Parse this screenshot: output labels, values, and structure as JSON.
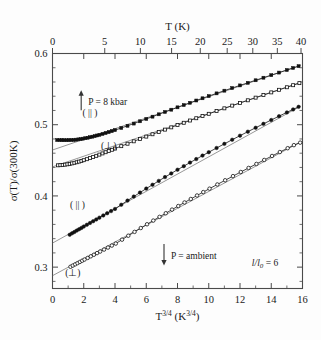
{
  "figure": {
    "name": "conductivity-vs-temperature-plot",
    "background": "#fdfdfd",
    "ink_color": "#111111"
  },
  "chart_data": {
    "type": "scatter",
    "title": "",
    "xlabel": "T3/4 (K3/4)",
    "xlabel_parts": {
      "base": "T",
      "exp": "3/4",
      "unit_base": "K",
      "unit_exp": "3/4"
    },
    "ylabel": "σ(T)/σ(300K)",
    "top_axis_label": "T (K)",
    "xlim": [
      0,
      16
    ],
    "ylim": [
      0.27,
      0.6
    ],
    "xticks": [
      0,
      2,
      4,
      6,
      8,
      10,
      12,
      14,
      16
    ],
    "xticklabels": [
      "0",
      "2",
      "4",
      "6",
      "8",
      "10",
      "12",
      "14",
      "16"
    ],
    "yticks": [
      0.3,
      0.4,
      0.5,
      0.6
    ],
    "yticklabels": [
      "0.3",
      "0.4",
      "0.5",
      "0.6"
    ],
    "top_ticks": [
      0,
      5,
      10,
      15,
      20,
      25,
      30,
      35,
      40
    ],
    "top_ticklabels": [
      "0",
      "5",
      "10",
      "15",
      "20",
      "25",
      "30",
      "35",
      "40"
    ],
    "grid": false,
    "legend_position": "inline-annotations",
    "annotations": [
      {
        "id": "pressure-8kbar",
        "text": "P = 8 kbar",
        "x": 1.9,
        "y": 0.533,
        "arrow": "up"
      },
      {
        "id": "pressure-ambient",
        "text": "P = ambient",
        "x": 7.2,
        "y": 0.317,
        "arrow": "down"
      },
      {
        "id": "disorder-ratio",
        "text": "l/l0 = 6",
        "x": 13.6,
        "y": 0.302
      },
      {
        "id": "label-8kbar-parallel",
        "text": "( || )",
        "x": 2.4,
        "y": 0.512
      },
      {
        "id": "label-8kbar-perp",
        "text": "(⊥)",
        "x": 3.6,
        "y": 0.466
      },
      {
        "id": "label-ambient-parallel",
        "text": "( || )",
        "x": 1.6,
        "y": 0.383
      },
      {
        "id": "label-ambient-perp",
        "text": "(⊥)",
        "x": 1.3,
        "y": 0.288
      }
    ],
    "series": [
      {
        "name": "P = 8 kbar, parallel",
        "short": "8kbar-parallel",
        "marker": "filled-square",
        "color": "#111111",
        "x": [
          0.3,
          0.45,
          0.6,
          0.75,
          0.9,
          1.05,
          1.2,
          1.35,
          1.5,
          1.65,
          1.8,
          1.95,
          2.1,
          2.25,
          2.4,
          2.55,
          2.7,
          2.85,
          3.0,
          3.2,
          3.4,
          3.6,
          3.8,
          4.0,
          4.4,
          4.8,
          5.2,
          5.6,
          6.0,
          6.4,
          6.8,
          7.2,
          7.6,
          8.0,
          8.4,
          8.8,
          9.2,
          9.6,
          10.0,
          10.5,
          11.0,
          11.5,
          12.0,
          12.5,
          13.0,
          13.5,
          14.0,
          14.5,
          15.0,
          15.4,
          15.75
        ],
        "y": [
          0.4785,
          0.4784,
          0.4783,
          0.4782,
          0.4782,
          0.4783,
          0.4785,
          0.4787,
          0.479,
          0.4794,
          0.4799,
          0.4804,
          0.481,
          0.4817,
          0.4824,
          0.4832,
          0.484,
          0.4849,
          0.4858,
          0.487,
          0.4883,
          0.4896,
          0.491,
          0.4924,
          0.4954,
          0.4985,
          0.5016,
          0.5048,
          0.5081,
          0.5113,
          0.5146,
          0.5179,
          0.5211,
          0.5244,
          0.5276,
          0.5308,
          0.534,
          0.5371,
          0.5402,
          0.544,
          0.5478,
          0.5515,
          0.5552,
          0.5588,
          0.5624,
          0.566,
          0.5696,
          0.5732,
          0.5768,
          0.5797,
          0.5822
        ]
      },
      {
        "name": "P = 8 kbar, perpendicular",
        "short": "8kbar-perp",
        "marker": "open-square",
        "color": "#111111",
        "x": [
          0.35,
          0.5,
          0.65,
          0.8,
          0.95,
          1.1,
          1.25,
          1.4,
          1.55,
          1.7,
          1.85,
          2.0,
          2.2,
          2.4,
          2.6,
          2.8,
          3.0,
          3.2,
          3.4,
          3.6,
          3.8,
          4.0,
          4.4,
          4.8,
          5.2,
          5.6,
          6.0,
          6.4,
          6.8,
          7.2,
          7.6,
          8.0,
          8.4,
          8.8,
          9.2,
          9.6,
          10.0,
          10.5,
          11.0,
          11.5,
          12.0,
          12.5,
          13.0,
          13.5,
          14.0,
          14.5,
          15.0,
          15.4,
          15.8
        ],
        "y": [
          0.443,
          0.4432,
          0.4435,
          0.4439,
          0.4444,
          0.445,
          0.4457,
          0.4465,
          0.4473,
          0.4482,
          0.4492,
          0.4502,
          0.4516,
          0.4531,
          0.4547,
          0.4563,
          0.458,
          0.4597,
          0.4614,
          0.4631,
          0.4648,
          0.4665,
          0.4699,
          0.4733,
          0.4767,
          0.48,
          0.4833,
          0.4866,
          0.4899,
          0.4931,
          0.4963,
          0.4995,
          0.5027,
          0.5059,
          0.5091,
          0.5122,
          0.5153,
          0.5192,
          0.523,
          0.5268,
          0.5306,
          0.5343,
          0.538,
          0.5417,
          0.5454,
          0.549,
          0.5526,
          0.5555,
          0.5584
        ]
      },
      {
        "name": "P = ambient, parallel",
        "short": "ambient-parallel",
        "marker": "filled-circle",
        "color": "#111111",
        "x": [
          1.1,
          1.25,
          1.4,
          1.55,
          1.7,
          1.85,
          2.0,
          2.2,
          2.4,
          2.6,
          2.8,
          3.0,
          3.25,
          3.5,
          3.75,
          4.0,
          4.4,
          4.8,
          5.2,
          5.6,
          6.0,
          6.4,
          6.8,
          7.2,
          7.6,
          8.0,
          8.4,
          8.8,
          9.2,
          9.6,
          10.0,
          10.5,
          11.0,
          11.5,
          12.0,
          12.5,
          13.0,
          13.5,
          14.0,
          14.5,
          15.0,
          15.4,
          15.75
        ],
        "y": [
          0.3455,
          0.3475,
          0.3494,
          0.3513,
          0.3532,
          0.3551,
          0.357,
          0.3595,
          0.362,
          0.3645,
          0.367,
          0.3695,
          0.3726,
          0.3757,
          0.3787,
          0.3817,
          0.3876,
          0.3934,
          0.3991,
          0.4047,
          0.4103,
          0.4157,
          0.4211,
          0.4264,
          0.4316,
          0.4368,
          0.4418,
          0.4468,
          0.4517,
          0.4566,
          0.4614,
          0.4673,
          0.4731,
          0.4789,
          0.4846,
          0.4902,
          0.4957,
          0.5012,
          0.5066,
          0.512,
          0.5173,
          0.5215,
          0.5251
        ]
      },
      {
        "name": "P = ambient, perpendicular",
        "short": "ambient-perp",
        "marker": "open-circle",
        "color": "#111111",
        "x": [
          1.15,
          1.3,
          1.45,
          1.6,
          1.75,
          1.9,
          2.05,
          2.25,
          2.45,
          2.65,
          2.85,
          3.05,
          3.3,
          3.55,
          3.8,
          4.05,
          4.45,
          4.85,
          5.25,
          5.65,
          6.05,
          6.45,
          6.85,
          7.25,
          7.65,
          8.05,
          8.45,
          8.85,
          9.25,
          9.65,
          10.05,
          10.55,
          11.05,
          11.55,
          12.05,
          12.55,
          13.05,
          13.55,
          14.05,
          14.55,
          15.05,
          15.45,
          15.85
        ],
        "y": [
          0.3005,
          0.3022,
          0.3039,
          0.3056,
          0.3073,
          0.309,
          0.3107,
          0.3129,
          0.3152,
          0.3174,
          0.3197,
          0.3219,
          0.3247,
          0.3275,
          0.3303,
          0.3331,
          0.3386,
          0.3441,
          0.3495,
          0.3549,
          0.3602,
          0.3654,
          0.3706,
          0.3757,
          0.3808,
          0.3858,
          0.3908,
          0.3957,
          0.4006,
          0.4054,
          0.4102,
          0.4161,
          0.422,
          0.4278,
          0.4336,
          0.4393,
          0.4449,
          0.4505,
          0.4561,
          0.4616,
          0.467,
          0.4713,
          0.4748
        ]
      }
    ],
    "guide_lines": [
      {
        "id": "guide-8kbar-parallel",
        "x1": 0.0,
        "y1": 0.4645,
        "x2": 15.9,
        "y2": 0.5835
      },
      {
        "id": "guide-8kbar-perp",
        "x1": 0.0,
        "y1": 0.4408,
        "x2": 15.9,
        "y2": 0.5596
      },
      {
        "id": "guide-ambient-parallel",
        "x1": 0.0,
        "y1": 0.3338,
        "x2": 15.9,
        "y2": 0.5263
      },
      {
        "id": "guide-ambient-perp",
        "x1": 0.0,
        "y1": 0.288,
        "x2": 15.9,
        "y2": 0.476
      }
    ]
  }
}
